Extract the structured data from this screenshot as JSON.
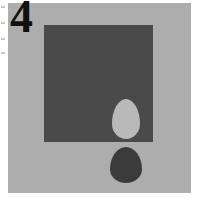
{
  "panel": {
    "label": "4",
    "background_color": "#ffffff",
    "field_color": "#adadad"
  },
  "shapes": {
    "square": {
      "name": "dark-square",
      "color": "#4a4a4a",
      "x": 44,
      "y": 25,
      "width": 109,
      "height": 117
    },
    "light_egg": {
      "name": "light-egg",
      "color": "#b9b9b9",
      "x": 112,
      "y": 99,
      "width": 28,
      "height": 40,
      "placement": "inside-square"
    },
    "dark_egg": {
      "name": "dark-egg",
      "color": "#3b3b3b",
      "x": 110,
      "y": 147,
      "width": 32,
      "height": 36,
      "placement": "below-square"
    }
  },
  "edge_marks": {
    "count": 4,
    "color": "#c9c9c9"
  }
}
